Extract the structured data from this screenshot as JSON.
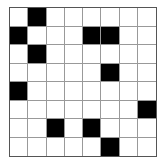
{
  "grid": {
    "rows": 8,
    "cols": 8,
    "filled_color": "#000000",
    "empty_color": "#ffffff",
    "cells": [
      [
        0,
        1,
        0,
        0,
        0,
        0,
        0,
        0
      ],
      [
        1,
        0,
        0,
        0,
        1,
        1,
        0,
        0
      ],
      [
        0,
        1,
        0,
        0,
        0,
        0,
        0,
        0
      ],
      [
        0,
        0,
        0,
        0,
        0,
        1,
        0,
        0
      ],
      [
        1,
        0,
        0,
        0,
        0,
        0,
        0,
        0
      ],
      [
        0,
        0,
        0,
        0,
        0,
        0,
        0,
        1
      ],
      [
        0,
        0,
        1,
        0,
        1,
        0,
        0,
        0
      ],
      [
        0,
        0,
        0,
        0,
        0,
        1,
        0,
        0
      ]
    ]
  }
}
